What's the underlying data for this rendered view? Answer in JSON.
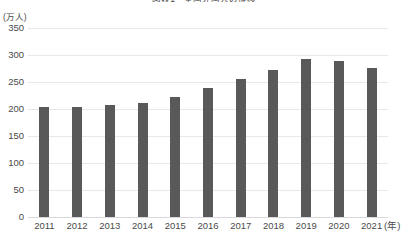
{
  "chart_data": {
    "type": "bar",
    "title": "図表1　全国外国人の推移",
    "subtitle": "",
    "xlabel": "(年)",
    "ylabel": "(万人)",
    "categories": [
      "2011",
      "2012",
      "2013",
      "2014",
      "2015",
      "2016",
      "2017",
      "2018",
      "2019",
      "2020",
      "2021"
    ],
    "values": [
      204,
      203,
      207,
      212,
      223,
      238,
      256,
      273,
      293,
      289,
      276
    ],
    "series": [
      {
        "name": "外国人数",
        "values": [
          204,
          203,
          207,
          212,
          223,
          238,
          256,
          273,
          293,
          289,
          276
        ]
      }
    ],
    "ylim": [
      0,
      350
    ],
    "yticks": [
      0,
      50,
      100,
      150,
      200,
      250,
      300,
      350
    ],
    "ytick_labels": [
      "0",
      "50",
      "100",
      "150",
      "200",
      "250",
      "300",
      "350"
    ],
    "grid": true,
    "grid_axis": "y",
    "legend": false,
    "legend_position": "none",
    "bar_color": "#595959",
    "grid_color": "#e8e8ea",
    "axis_color": "#d9d9dc",
    "text_color": "#4a4a4a",
    "background": "#ffffff"
  }
}
